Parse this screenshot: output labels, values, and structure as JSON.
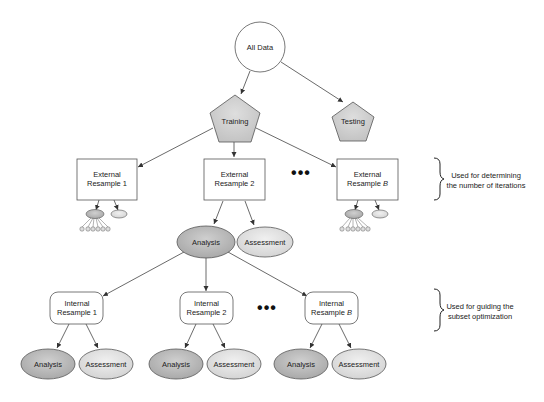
{
  "diagram": {
    "root": {
      "label": "All Data"
    },
    "training": {
      "label": "Training"
    },
    "testing": {
      "label": "Testing"
    },
    "external_resamples": [
      {
        "line1": "External",
        "line2": "Resample 1"
      },
      {
        "line1": "External",
        "line2": "Resample 2"
      },
      {
        "line1": "External",
        "line2": "Resample ",
        "italic_suffix": "B"
      }
    ],
    "external_split": {
      "analysis": "Analysis",
      "assessment": "Assessment"
    },
    "internal_resamples": [
      {
        "line1": "Internal",
        "line2": "Resample 1",
        "analysis": "Analysis",
        "assessment": "Assessment"
      },
      {
        "line1": "Internal",
        "line2": "Resample 2",
        "analysis": "Analysis",
        "assessment": "Assessment"
      },
      {
        "line1": "Internal",
        "line2": "Resample ",
        "italic_suffix": "B",
        "analysis": "Analysis",
        "assessment": "Assessment"
      }
    ],
    "ellipsis": "•••",
    "annotations": [
      {
        "line1": "Used for determining",
        "line2": "the number of iterations"
      },
      {
        "line1": "Used for guiding the",
        "line2": "subset optimization"
      }
    ],
    "colors": {
      "pentagon_fill": "#d6d6d6",
      "analysis_fill": "#bdbdbd",
      "assessment_fill": "#e6e6e6",
      "stroke": "#555555",
      "line": "#444444"
    }
  }
}
